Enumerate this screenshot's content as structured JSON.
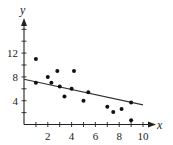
{
  "chart_data": {
    "type": "scatter",
    "title": "",
    "xlabel": "x",
    "ylabel": "y",
    "xlim": [
      0,
      10
    ],
    "ylim": [
      0,
      16
    ],
    "xticks": [
      2,
      4,
      6,
      8,
      10
    ],
    "yticks": [
      4,
      8,
      12
    ],
    "grid": false,
    "legend": null,
    "series": [
      {
        "name": "data points",
        "points": [
          [
            1,
            11
          ],
          [
            1,
            7
          ],
          [
            2,
            8
          ],
          [
            2.3,
            7
          ],
          [
            2.8,
            9
          ],
          [
            3,
            6.4
          ],
          [
            3.4,
            4.7
          ],
          [
            4,
            6
          ],
          [
            4.2,
            9
          ],
          [
            5,
            4
          ],
          [
            5.4,
            5.4
          ],
          [
            7,
            3
          ],
          [
            7.5,
            2.1
          ],
          [
            8.2,
            2.6
          ],
          [
            9,
            3.7
          ],
          [
            9,
            0.7
          ]
        ]
      }
    ],
    "trend_line": {
      "x": [
        0,
        10
      ],
      "y": [
        7.6,
        3.3
      ]
    }
  },
  "labels": {
    "x_axis": "x",
    "y_axis": "y",
    "x_ticks": [
      "2",
      "4",
      "6",
      "8",
      "10"
    ],
    "y_ticks": [
      "4",
      "8",
      "12"
    ]
  }
}
